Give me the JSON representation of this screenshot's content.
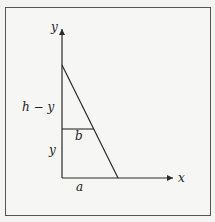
{
  "diagram": {
    "axes": {
      "x_label": "x",
      "y_label": "y"
    },
    "labels": {
      "h_minus_y": "h − y",
      "y_segment": "y",
      "b_segment": "b",
      "a_segment": "a"
    },
    "colors": {
      "line": "#2a2a2a",
      "frame": "#555555",
      "background": "#f6f6f4"
    }
  }
}
